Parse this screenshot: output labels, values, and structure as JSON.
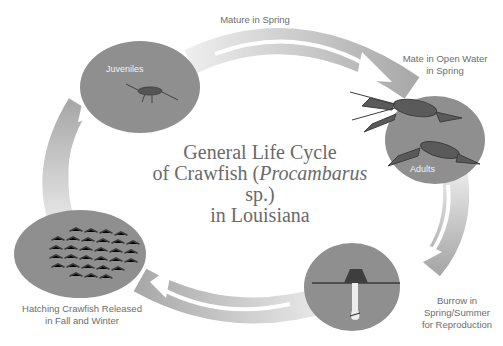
{
  "title": {
    "line1": "General Life Cycle",
    "line2_prefix": "of Crawfish (",
    "line2_italic": "Procambarus",
    "line2_suffix": " sp.)",
    "line3": "in Louisiana"
  },
  "stages": [
    {
      "id": "juveniles",
      "inner_label": "Juveniles",
      "outer_label": ""
    },
    {
      "id": "adults",
      "inner_label": "Adults",
      "outer_label_lines": [
        "Mate in Open Water",
        "in Spring"
      ]
    },
    {
      "id": "burrow",
      "inner_label": "",
      "outer_label_lines": [
        "Burrow in",
        "Spring/Summer",
        "for Reproduction"
      ]
    },
    {
      "id": "hatchlings",
      "inner_label": "",
      "outer_label_lines": [
        "Hatching Crawfish Released",
        "in Fall and Winter"
      ]
    }
  ],
  "transitions": {
    "top": "Mature in Spring"
  },
  "colors": {
    "circle": "#8f8f8f",
    "arrow_dark": "#a8a8a8",
    "arrow_light": "#ececec",
    "text": "#6d6d6d",
    "title": "#6a6a6a"
  }
}
